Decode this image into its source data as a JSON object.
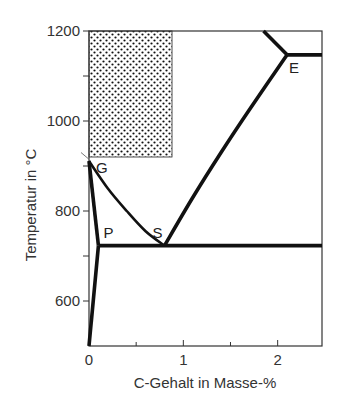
{
  "chart_data": {
    "type": "line",
    "title": "",
    "xlabel": "C-Gehalt in Masse-%",
    "ylabel": "Temperatur in °C",
    "xlim": [
      0,
      2.47
    ],
    "ylim": [
      500,
      1200
    ],
    "x_ticks": [
      0,
      0.5,
      1,
      1.5,
      2
    ],
    "x_tick_labels": [
      "0",
      "",
      "1",
      "",
      "2"
    ],
    "y_ticks": [
      600,
      700,
      800,
      900,
      1000,
      1100,
      1200
    ],
    "y_tick_labels": [
      "600",
      "",
      "800",
      "",
      "1000",
      "",
      "1200"
    ],
    "grid": false,
    "points": [
      {
        "label": "G",
        "x": 0.0,
        "y": 911
      },
      {
        "label": "P",
        "x": 0.1,
        "y": 723
      },
      {
        "label": "S",
        "x": 0.8,
        "y": 723
      },
      {
        "label": "E",
        "x": 2.1,
        "y": 1147
      }
    ],
    "series": [
      {
        "name": "GP",
        "points": [
          [
            0.0,
            911
          ],
          [
            0.1,
            723
          ]
        ]
      },
      {
        "name": "P-solvus",
        "points": [
          [
            0.1,
            723
          ],
          [
            0.0,
            500
          ]
        ]
      },
      {
        "name": "GS",
        "points": [
          [
            0.0,
            911
          ],
          [
            0.2,
            850
          ],
          [
            0.4,
            800
          ],
          [
            0.6,
            755
          ],
          [
            0.8,
            723
          ]
        ]
      },
      {
        "name": "SE",
        "points": [
          [
            0.8,
            723
          ],
          [
            1.1,
            830
          ],
          [
            1.4,
            930
          ],
          [
            1.7,
            1025
          ],
          [
            2.1,
            1147
          ]
        ]
      },
      {
        "name": "PSK",
        "points": [
          [
            0.1,
            723
          ],
          [
            2.47,
            723
          ]
        ]
      },
      {
        "name": "E-line",
        "points": [
          [
            2.1,
            1147
          ],
          [
            2.47,
            1147
          ]
        ]
      },
      {
        "name": "liquidus",
        "points": [
          [
            1.85,
            1200
          ],
          [
            2.1,
            1147
          ]
        ]
      }
    ],
    "shaded_region": {
      "x": [
        0,
        0.88
      ],
      "y": [
        920,
        1200
      ],
      "pattern": "dots"
    }
  }
}
